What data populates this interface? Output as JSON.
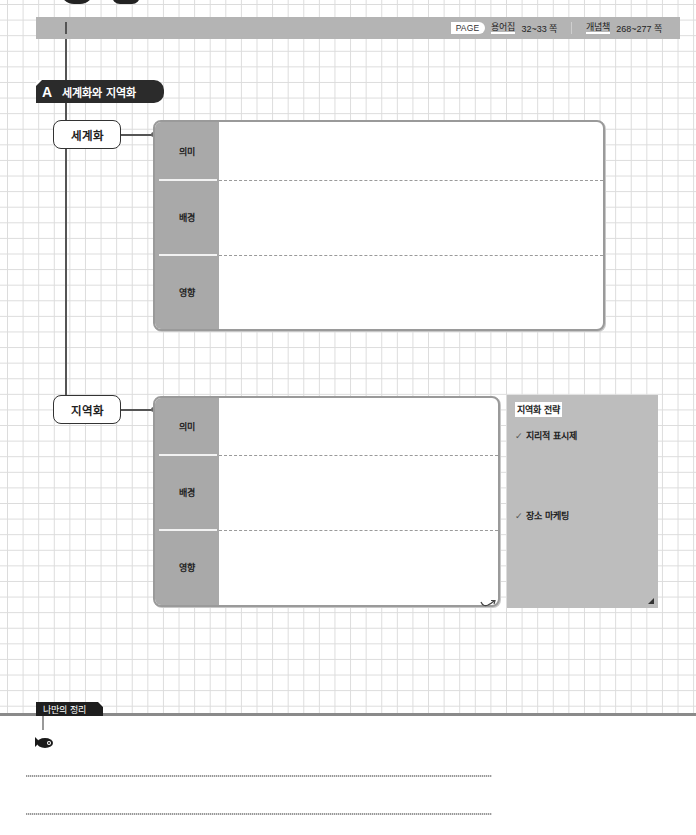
{
  "header": {
    "page_badge": "PAGE",
    "glossary_label": "용어집",
    "glossary_pages": "32~33 쪽",
    "concept_label": "개념책",
    "concept_pages": "268~277 쪽"
  },
  "section": {
    "letter": "A",
    "title": "세계화와 지역화"
  },
  "globalization": {
    "node_label": "세계화",
    "rows": [
      {
        "label": "의미",
        "content": ""
      },
      {
        "label": "배경",
        "content": ""
      },
      {
        "label": "영향",
        "content": ""
      }
    ]
  },
  "localization": {
    "node_label": "지역화",
    "rows": [
      {
        "label": "의미",
        "content": ""
      },
      {
        "label": "배경",
        "content": ""
      },
      {
        "label": "영향",
        "content": ""
      }
    ]
  },
  "strategy": {
    "title": "지역화 전략",
    "items": [
      {
        "check": "✓",
        "label": "지리적 표시제"
      },
      {
        "check": "✓",
        "label": "장소 마케팅"
      }
    ]
  },
  "summary": {
    "label": "나만의 정리",
    "lines": [
      "",
      ""
    ]
  },
  "colors": {
    "header_bar": "#b4b4b4",
    "section_label_bg": "#2b2b2b",
    "card_label_col": "#a9a9a9",
    "strategy_panel": "#bdbdbd",
    "grid_line": "#dcdcdc"
  }
}
